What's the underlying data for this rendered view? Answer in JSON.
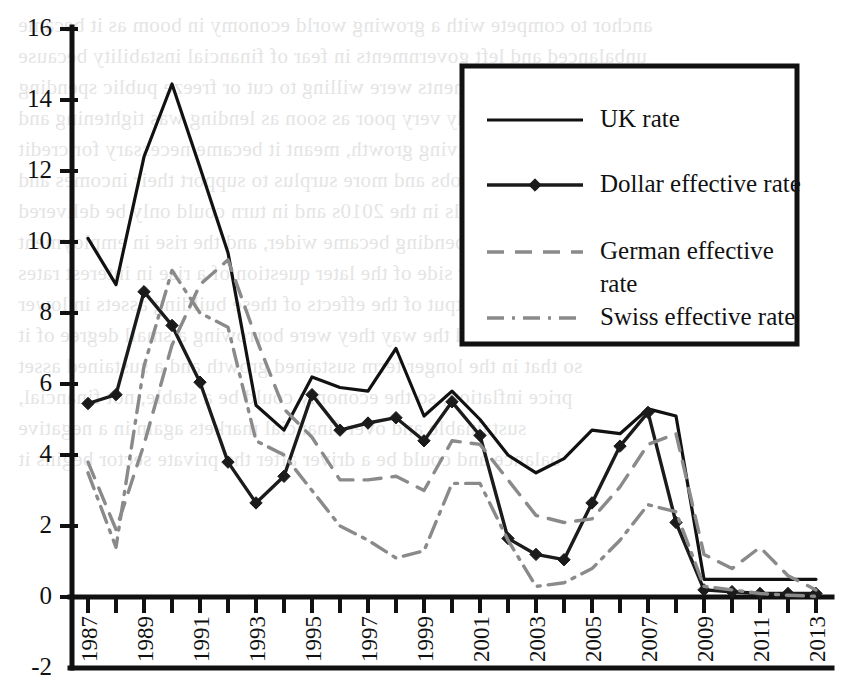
{
  "chart_data": {
    "type": "line",
    "title": "",
    "xlabel": "",
    "ylabel": "",
    "xlim": [
      1987,
      2013
    ],
    "ylim": [
      -2,
      16
    ],
    "ytick_step": 2,
    "grid": false,
    "legend_position": "top-right",
    "x": [
      1987,
      1988,
      1989,
      1990,
      1991,
      1992,
      1993,
      1994,
      1995,
      1996,
      1997,
      1998,
      1999,
      2000,
      2001,
      2002,
      2003,
      2004,
      2005,
      2006,
      2007,
      2008,
      2009,
      2010,
      2011,
      2012,
      2013
    ],
    "xtick_labels": [
      "1987",
      "1989",
      "1991",
      "1993",
      "1995",
      "1997",
      "1999",
      "2001",
      "2003",
      "2005",
      "2007",
      "2009",
      "2011",
      "2013"
    ],
    "ytick_labels": [
      "-2",
      "0",
      "2",
      "4",
      "6",
      "8",
      "10",
      "12",
      "14",
      "16"
    ],
    "series": [
      {
        "name": "UK rate",
        "style": "solid",
        "color": "#111111",
        "marker": "none",
        "values": [
          10.1,
          8.8,
          12.4,
          14.45,
          12.1,
          9.7,
          5.4,
          4.7,
          6.2,
          5.9,
          5.8,
          7.0,
          5.1,
          5.8,
          5.0,
          4.0,
          3.5,
          3.9,
          4.7,
          4.6,
          5.3,
          5.1,
          0.5,
          0.5,
          0.5,
          0.5,
          0.5
        ]
      },
      {
        "name": "Dollar effective rate",
        "style": "solid-marker",
        "color": "#1b1b1b",
        "marker": "diamond",
        "values": [
          5.45,
          5.7,
          8.6,
          7.65,
          6.05,
          3.8,
          2.65,
          3.4,
          5.7,
          4.7,
          4.9,
          5.05,
          4.4,
          5.5,
          4.55,
          1.65,
          1.2,
          1.05,
          2.65,
          4.25,
          5.2,
          2.1,
          0.2,
          0.15,
          0.1,
          0.1,
          0.1
        ]
      },
      {
        "name": "German effective rate",
        "style": "dashed",
        "color": "#8a8a8a",
        "marker": "none",
        "values": [
          3.8,
          1.9,
          4.3,
          7.1,
          8.8,
          9.5,
          7.3,
          5.3,
          4.5,
          3.3,
          3.3,
          3.4,
          3.0,
          4.4,
          4.3,
          3.3,
          2.3,
          2.1,
          2.2,
          3.1,
          4.3,
          4.6,
          1.2,
          0.8,
          1.4,
          0.6,
          0.2
        ]
      },
      {
        "name": "Swiss effective rate",
        "style": "dashdot",
        "color": "#8a8a8a",
        "marker": "none",
        "values": [
          3.5,
          1.4,
          6.5,
          9.2,
          8.0,
          7.6,
          4.4,
          4.0,
          3.0,
          2.0,
          1.6,
          1.1,
          1.3,
          3.2,
          3.2,
          1.6,
          0.3,
          0.4,
          0.8,
          1.6,
          2.6,
          2.4,
          0.3,
          0.2,
          0.1,
          0.05,
          0.02
        ]
      }
    ]
  },
  "legend": {
    "items": [
      {
        "label": "UK rate",
        "style": "solid"
      },
      {
        "label": "Dollar effective rate",
        "style": "solid-marker"
      },
      {
        "label": "German effective",
        "label2": "rate",
        "style": "dashed"
      },
      {
        "label": "Swiss effective rate",
        "style": "dashdot"
      }
    ]
  },
  "background_text": {
    "lines": [
      "anchor to compete with a growing world economy in boom as it became",
      "unbalanced and left governments in fear of financial instability because",
      "governments were willing to cut or freeze public spending",
      "growth was already very poor as soon as lending was tightening and",
      "asset prices, reviving growth, meant it became necessary for credit",
      "to create more jobs and more surplus to support their incomes and",
      "demand because falls in the 2010s and in turn could only be delivered",
      "after cuts; so spending became wider, and the rise in employment",
      "and the other side of the later question of a rise in interest rates",
      "and the output of the effects of these building assets in lower",
      "households and the way they were borrowing a small degree of it",
      "so that in the longer term sustained growth and a sustained asset",
      "price inflation; so the economy could be a stable, not financial,",
      "sustainable and over financial markets again in a negative",
      "balance and could be a driver after the private sector begins it"
    ]
  }
}
